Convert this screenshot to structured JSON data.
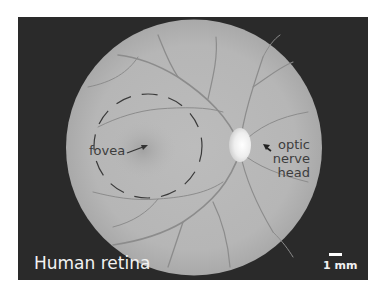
{
  "figure": {
    "title": "Human retina",
    "labels": {
      "fovea": "fovea",
      "optic_nerve_head": [
        "optic",
        "nerve",
        "head"
      ]
    },
    "scale_bar": {
      "label": "1 mm"
    },
    "colors": {
      "background": "#2a2a2a",
      "fundus": "#b9b9b9",
      "vessel": "#8a8a8a",
      "optic_disc": "#f0f0f0",
      "label_text": "#3d3d3d",
      "title_text": "#f2f2f2"
    }
  }
}
